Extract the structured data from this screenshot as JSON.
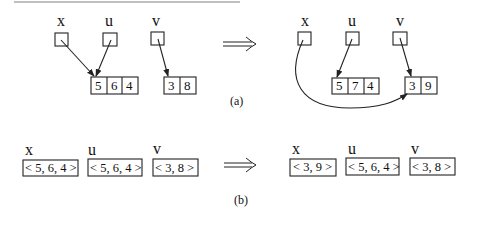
{
  "figure": {
    "part_a": {
      "caption": "(a)",
      "before": {
        "pointers": [
          {
            "label": "x",
            "points_to": "array1"
          },
          {
            "label": "u",
            "points_to": "array1"
          },
          {
            "label": "v",
            "points_to": "array2"
          }
        ],
        "array1": [
          "5",
          "6",
          "4"
        ],
        "array2": [
          "3",
          "8"
        ]
      },
      "after": {
        "pointers": [
          {
            "label": "x",
            "points_to": "array2"
          },
          {
            "label": "u",
            "points_to": "array1"
          },
          {
            "label": "v",
            "points_to": "array2"
          }
        ],
        "array1": [
          "5",
          "7",
          "4"
        ],
        "array2": [
          "3",
          "9"
        ]
      },
      "arrow": "⟹"
    },
    "part_b": {
      "caption": "(b)",
      "before": [
        {
          "label": "x",
          "value": "< 5, 6, 4 >"
        },
        {
          "label": "u",
          "value": "< 5, 6, 4 >"
        },
        {
          "label": "v",
          "value": "< 3, 8 >"
        }
      ],
      "after": [
        {
          "label": "x",
          "value": "< 3, 9 >"
        },
        {
          "label": "u",
          "value": "< 5, 6, 4 >"
        },
        {
          "label": "v",
          "value": "< 3, 8 >"
        }
      ],
      "arrow": "⟹"
    }
  }
}
